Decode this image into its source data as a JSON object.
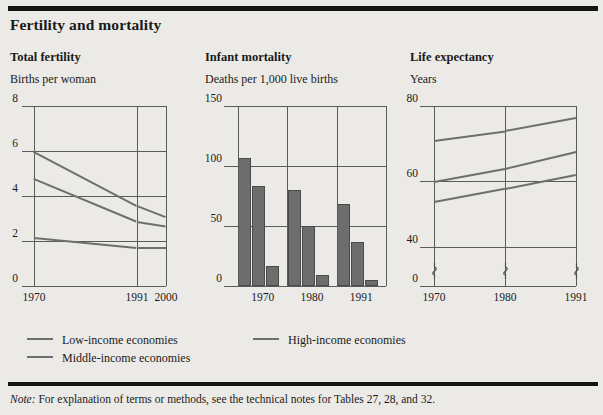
{
  "figure": {
    "title": "Fertility and mortality",
    "note_label": "Note:",
    "note_text": "For explanation of terms or methods, see the technical notes for Tables 27, 28, and 32."
  },
  "legend": {
    "items": [
      {
        "label": "Low-income economies",
        "color": "#6e6e6e"
      },
      {
        "label": "Middle-income economies",
        "color": "#6e6e6e"
      },
      {
        "label": "High-income economies",
        "color": "#6e6e6e"
      }
    ]
  },
  "chart_data": [
    {
      "type": "line",
      "title": "Total fertility",
      "ylabel": "Births per woman",
      "xlabel": "",
      "x": [
        "1970",
        "1991",
        "2000"
      ],
      "x_positions": [
        0,
        0.78,
        1.0
      ],
      "yticks": [
        0,
        2,
        4,
        6,
        8
      ],
      "ylim": [
        0,
        8
      ],
      "grid": true,
      "series": [
        {
          "name": "Low-income economies",
          "values": [
            6.0,
            3.6,
            3.1
          ]
        },
        {
          "name": "Middle-income economies",
          "values": [
            4.8,
            2.9,
            2.7
          ]
        },
        {
          "name": "High-income economies",
          "values": [
            2.2,
            1.75,
            1.75
          ]
        }
      ]
    },
    {
      "type": "bar",
      "title": "Infant mortality",
      "ylabel": "Deaths per 1,000 live births",
      "xlabel": "",
      "categories": [
        "1970",
        "1980",
        "1991"
      ],
      "yticks": [
        0,
        50,
        100,
        150
      ],
      "ylim": [
        0,
        150
      ],
      "grid": true,
      "series": [
        {
          "name": "Low-income economies",
          "values": [
            107,
            80,
            68
          ]
        },
        {
          "name": "Middle-income economies",
          "values": [
            83,
            50,
            37
          ]
        },
        {
          "name": "High-income economies",
          "values": [
            17,
            9,
            5
          ]
        }
      ]
    },
    {
      "type": "line",
      "title": "Life expectancy",
      "ylabel": "Years",
      "xlabel": "",
      "x": [
        "1970",
        "1980",
        "1991"
      ],
      "x_positions": [
        0,
        0.5,
        1.0
      ],
      "yticks": [
        0,
        40,
        60,
        80
      ],
      "ylim": [
        36,
        80
      ],
      "axis_break": true,
      "grid": true,
      "series": [
        {
          "name": "High-income economies",
          "values": [
            71.0,
            73.5,
            77.0
          ]
        },
        {
          "name": "Middle-income economies",
          "values": [
            60.0,
            63.5,
            68.0
          ]
        },
        {
          "name": "Low-income economies",
          "values": [
            54.0,
            58.0,
            62.0
          ]
        }
      ]
    }
  ]
}
